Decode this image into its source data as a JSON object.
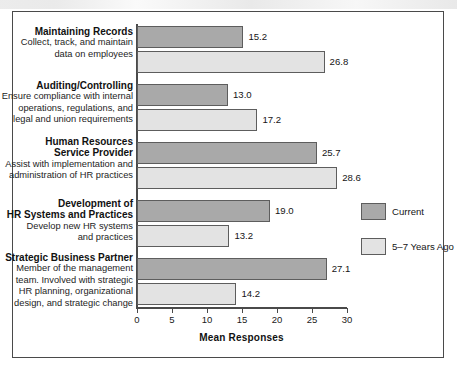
{
  "chart_data": {
    "type": "bar",
    "orientation": "horizontal",
    "title": "",
    "xlabel": "Mean Responses",
    "ylabel": "",
    "xlim": [
      0,
      30
    ],
    "xticks": [
      0,
      5,
      10,
      15,
      20,
      25,
      30
    ],
    "grid": false,
    "legend_position": "right",
    "colors": {
      "current": "#a9a9a9",
      "past": "#e3e3e3",
      "outline": "#5d5d5d",
      "frame": "#4a4a4a",
      "text": "#111111"
    },
    "categories": [
      {
        "title": "Maintaining Records",
        "description": [
          "Collect, track, and maintain",
          "data on employees"
        ]
      },
      {
        "title": "Auditing/Controlling",
        "description": [
          "Ensure compliance with internal",
          "operations, regulations, and",
          "legal and union requirements"
        ]
      },
      {
        "title": "Human Resources\nService Provider",
        "title_lines": [
          "Human Resources",
          "Service Provider"
        ],
        "description": [
          "Assist with implementation and",
          "administration of HR practices"
        ]
      },
      {
        "title": "Development of\nHR Systems and Practices",
        "title_lines": [
          "Development of",
          "HR Systems and Practices"
        ],
        "description": [
          "Develop new HR systems",
          "and practices"
        ]
      },
      {
        "title": "Strategic Business Partner",
        "description": [
          "Member of the management",
          "team. Involved with strategic",
          "HR planning, organizational",
          "design, and strategic change"
        ]
      }
    ],
    "series": [
      {
        "name": "Current",
        "values": [
          15.2,
          13.0,
          25.7,
          19.0,
          27.1
        ],
        "labels": [
          "15.2",
          "13.0",
          "25.7",
          "19.0",
          "27.1"
        ]
      },
      {
        "name": "5–7 Years Ago",
        "values": [
          26.8,
          17.2,
          28.6,
          13.2,
          14.2
        ],
        "labels": [
          "26.8",
          "17.2",
          "28.6",
          "13.2",
          "14.2"
        ]
      }
    ],
    "legend": [
      {
        "label": "Current",
        "swatch": "current"
      },
      {
        "label": "5–7 Years Ago",
        "swatch": "past"
      }
    ],
    "tick_labels": [
      "0",
      "5",
      "10",
      "15",
      "20",
      "25",
      "30"
    ]
  }
}
